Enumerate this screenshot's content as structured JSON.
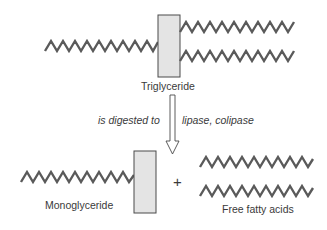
{
  "diagram": {
    "labels": {
      "triglyceride": "Triglyceride",
      "process": "is digested to",
      "enzymes": "lipase, colipase",
      "monoglyceride": "Monoglyceride",
      "plus": "+",
      "free_fatty_acids": "Free fatty acids"
    },
    "nodes": [
      {
        "id": "triglyceride",
        "label": "Triglyceride",
        "glycerol_box": [
          158,
          15,
          22,
          62
        ],
        "chains": 3
      },
      {
        "id": "monoglyceride",
        "label": "Monoglyceride",
        "glycerol_box": [
          134,
          150,
          22,
          63
        ],
        "chains": 1
      },
      {
        "id": "free_fatty_acids",
        "label": "Free fatty acids",
        "chains": 2
      }
    ],
    "edges": [
      {
        "from": "triglyceride",
        "to": "monoglyceride + free_fatty_acids",
        "label_left": "is digested to",
        "label_right": "lipase, colipase",
        "style": "hollow-arrow"
      }
    ],
    "colors": {
      "chain": "#5a5a5a",
      "glycerol_fill": "#e4e4e4",
      "outline": "#4a4a4a",
      "text": "#3a3a3a"
    }
  }
}
